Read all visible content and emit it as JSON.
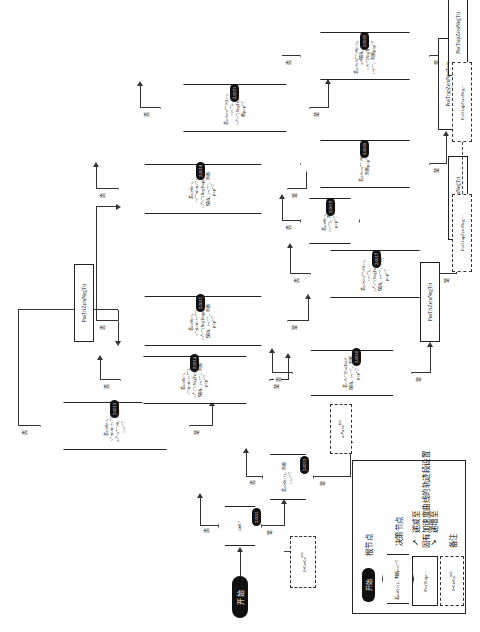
{
  "diagram": {
    "start_label": "开始",
    "branch_yes": "是",
    "branch_no": "否"
  },
  "legend": {
    "rows": [
      {
        "shape": "start-pill",
        "sample": "开始",
        "label": "根节点"
      },
      {
        "shape": "hexagon",
        "sample": "若a≻0(v↑)，判断v≤v<sup>tgt</sup>？",
        "badge": "2.0001",
        "label": "决策节点"
      },
      {
        "shape": "rect",
        "sample": "PosTrap···",
        "label": "固有加速度曲线的轨迹段设置"
      },
      {
        "shape": "dashed-rect",
        "sample": "0≺a≺a<sup>max</sup>",
        "label": "备注"
      },
      {
        "shape": "arrow-down",
        "sample": "↗",
        "label": "递减至"
      },
      {
        "shape": "arrow-up",
        "sample": "↘",
        "label": "递增至"
      }
    ]
  },
  "decisions": [
    {
      "id": "2.0011",
      "text": "a≽0 ?"
    },
    {
      "id": "2.0012",
      "text": "若a≻0(v↑)，判断v≤v<sup>tgt</sup>？"
    },
    {
      "id": "2.0013",
      "text": "若a≻0(v↑，v<sup>tgt</sup>≼v≼v+v<sup>max</sup>)，a↗−a<sup>max</sup>↗0，判断v≤v<sup>tgt</sup>？"
    },
    {
      "id": "2.0014",
      "text": "若a≻0(v↑，v<sup>tgt</sup>≼v≼v+v<sup>max</sup>)，v↗v<sup>tgt</sup>(NegTri)，a↗保持，t=t<sup>sync</sup>，判断p≥p<sup>tgt</sup>？"
    },
    {
      "id": "2.0015",
      "text": "若a≻0(v↑，v<sup>tgt</sup>≼v≼v+v<sup>max</sup>)，v↗v<sup>tgt</sup>(NegTrap)，a↗保持，t=t<sup>sync</sup>，判断p≥p<sup>tgt</sup>？"
    },
    {
      "id": "2.0016",
      "text": "若v↗v<sup>tgt</sup>(PosTri)↗保持，t=t<sup>sync</sup>，判断p≤p<sup>tgt</sup>？"
    },
    {
      "id": "2.0017",
      "text": "若a↗a+a<sup>max</sup>↗0(v↑，v≥v<sup>tgt</sup>)，v↗v<sup>tgt</sup>(NegTri)，a↗保持，t=t<sup>sync</sup>，判断p≤p<sup>tgt</sup>？"
    },
    {
      "id": "2.0018",
      "text": "若a≻0(v↑，−v<sup>max</sup>≼v≼v<sup>tgt</sup>)，v↗v<sup>tgt</sup>(NegTrap)，a↗保持，t=t<sup>sync</sup>，判断p≤p<sup>tgt</sup>？"
    },
    {
      "id": "2.0019",
      "text": "若a≻0(v↑，v≥v<sup>tgt</sup>)，判断p≥p<sup>tgt</sup>？"
    },
    {
      "id": "2.0020",
      "text": "若a↗a+a<sup>max</sup>↗0(v↑)，判断p≤p<sup>tgt</sup>？"
    },
    {
      "id": "2.0021",
      "text": "若a↗a+a<sup>max</sup>↗0(v↑，v≥v<sup>tgt</sup>)，v↗v<sup>tgt</sup>(NegTri)，判断p≥p<sup>tgt</sup>？"
    },
    {
      "id": "2.0022",
      "text": "若a↗a+a<sup>max</sup>↗0(v↑)，a↗保持，v↗v<sup>tgt</sup>(NegTri)，t=t<sup>sync</sup>，判断p≤p<sup>tgt</sup>？"
    },
    {
      "id": "2.0023",
      "text": "若a↗a+a<sup>max</sup>↗保持↗0(v↑，v≥v<sup>tgt</sup>)，a↗−a<sup>max</sup>↗0↗保持，t=t<sup>sync</sup>，判断p≤p<sup>tgt</sup>？"
    },
    {
      "id": "2.0024",
      "text": "若v↗v<sup>tgt</sup>↗保持，判断p≤p<sup>tgt</sup>？"
    },
    {
      "id": "2.0025",
      "text": "若a↗a+a<sup>max</sup>↗0(v↑，v≥v<sup>tgt</sup>)，a↗保持，v↗v<sup>tgt</sup>(NegTrap)，t=t<sup>sync</sup>？"
    }
  ],
  "terminals": [
    {
      "label": "PosTriZeroNegTri"
    },
    {
      "label": "PosTrapZeroNegTri"
    },
    {
      "label": "PosTriZeroNegTri"
    },
    {
      "label": "PosTrapZeroNegTrap"
    },
    {
      "label": "PosTrapZeroNegTri"
    }
  ],
  "notes": [
    {
      "text": "0≺a≺a<sup>max</sup>"
    },
    {
      "text": "a↗a+a<sup>max</sup>"
    },
    {
      "text": "PosTrapZeroNeg···"
    },
    {
      "text": "PosTrapZeroNeg···"
    }
  ]
}
